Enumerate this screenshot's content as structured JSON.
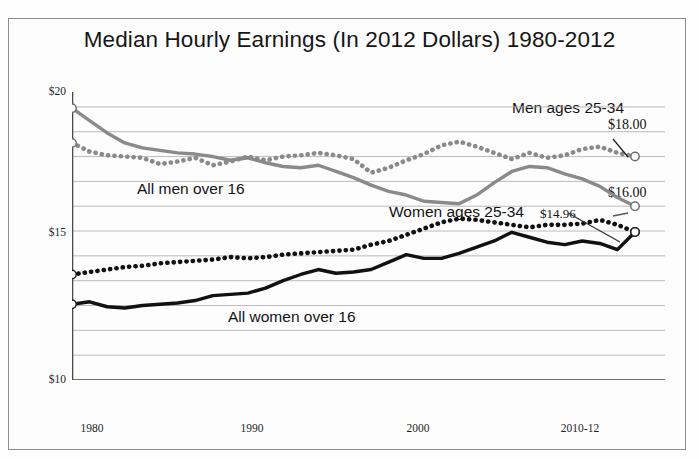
{
  "chart_data": {
    "type": "line",
    "title": "Median Hourly Earnings (In 2012 Dollars) 1980-2012",
    "xlabel": "",
    "ylabel": "",
    "xlim": [
      1980,
      2012
    ],
    "ylim": [
      9,
      20.6
    ],
    "grid": true,
    "grid_interval": 1,
    "legend_position": "inline-annotations",
    "y_ticks": [
      10,
      15,
      20
    ],
    "y_tick_labels": [
      "$10",
      "$15",
      "$20"
    ],
    "x_ticks": [
      1980,
      1990,
      2000,
      2010
    ],
    "x_tick_labels": [
      "1980",
      "1990",
      "2000",
      "2010-12"
    ],
    "x": [
      1980,
      1981,
      1982,
      1983,
      1984,
      1985,
      1986,
      1987,
      1988,
      1989,
      1990,
      1991,
      1992,
      1993,
      1994,
      1995,
      1996,
      1997,
      1998,
      1999,
      2000,
      2001,
      2002,
      2003,
      2004,
      2005,
      2006,
      2007,
      2008,
      2009,
      2010,
      2011,
      2012
    ],
    "series": [
      {
        "name": "Men ages 25-34",
        "style": "dotted",
        "color": "#8a8a8a",
        "end_value_label": "$18.00",
        "values": [
          18.55,
          18.2,
          18.05,
          18.0,
          17.95,
          17.7,
          17.8,
          17.95,
          17.65,
          17.8,
          18.0,
          17.85,
          18.0,
          18.05,
          18.15,
          18.05,
          17.9,
          17.35,
          17.55,
          17.85,
          18.1,
          18.45,
          18.6,
          18.4,
          18.15,
          17.9,
          18.15,
          17.95,
          18.05,
          18.3,
          18.4,
          18.15,
          18.0
        ]
      },
      {
        "name": "All men over 16",
        "style": "solid",
        "color": "#8a8a8a",
        "end_value_label": "$16.00",
        "values": [
          19.95,
          19.45,
          18.95,
          18.55,
          18.35,
          18.25,
          18.15,
          18.1,
          18.0,
          17.85,
          17.95,
          17.75,
          17.6,
          17.55,
          17.65,
          17.4,
          17.15,
          16.85,
          16.6,
          16.45,
          16.2,
          16.15,
          16.1,
          16.45,
          16.95,
          17.4,
          17.6,
          17.55,
          17.3,
          17.1,
          16.8,
          16.35,
          16.0
        ]
      },
      {
        "name": "Women ages 25-34",
        "style": "dotted",
        "color": "#111111",
        "end_value_label": "$14.96",
        "values": [
          13.25,
          13.35,
          13.45,
          13.55,
          13.6,
          13.7,
          13.75,
          13.8,
          13.85,
          13.95,
          13.9,
          13.95,
          14.05,
          14.1,
          14.15,
          14.2,
          14.25,
          14.45,
          14.6,
          14.85,
          15.1,
          15.35,
          15.5,
          15.45,
          15.35,
          15.25,
          15.15,
          15.25,
          15.25,
          15.3,
          15.45,
          15.25,
          14.96
        ]
      },
      {
        "name": "All women over 16",
        "style": "solid",
        "color": "#111111",
        "end_value_label": "$14.96",
        "values": [
          12.05,
          12.15,
          11.95,
          11.9,
          12.0,
          12.05,
          12.1,
          12.2,
          12.4,
          12.45,
          12.5,
          12.7,
          13.0,
          13.25,
          13.45,
          13.3,
          13.35,
          13.45,
          13.75,
          14.05,
          13.9,
          13.9,
          14.1,
          14.35,
          14.6,
          14.95,
          14.75,
          14.55,
          14.45,
          14.6,
          14.5,
          14.25,
          14.96
        ]
      }
    ],
    "annotations": [
      {
        "text": "Men ages 25-34",
        "series": "Men ages 25-34"
      },
      {
        "text": "All men over 16",
        "series": "All men over 16"
      },
      {
        "text": "Women ages 25-34",
        "series": "Women ages 25-34"
      },
      {
        "text": "All women over 16",
        "series": "All women over 16"
      },
      {
        "text": "$18.00",
        "series": "Men ages 25-34",
        "type": "end-value"
      },
      {
        "text": "$16.00",
        "series": "All men over 16",
        "type": "end-value"
      },
      {
        "text": "$14.96",
        "series": "Women ages 25-34",
        "type": "end-value"
      }
    ]
  },
  "title": "Median Hourly Earnings (In 2012 Dollars) 1980-2012",
  "y_axis": {
    "t20": "$20",
    "t15": "$15",
    "t10": "$10"
  },
  "x_axis": {
    "t1980": "1980",
    "t1990": "1990",
    "t2000": "2000",
    "t2010": "2010-12"
  },
  "labels": {
    "men_25_34": "Men ages 25-34",
    "all_men": "All men over 16",
    "women_25_34": "Women ages 25-34",
    "all_women": "All women over 16",
    "val_18": "$18.00",
    "val_16": "$16.00",
    "val_1496": "$14.96"
  }
}
